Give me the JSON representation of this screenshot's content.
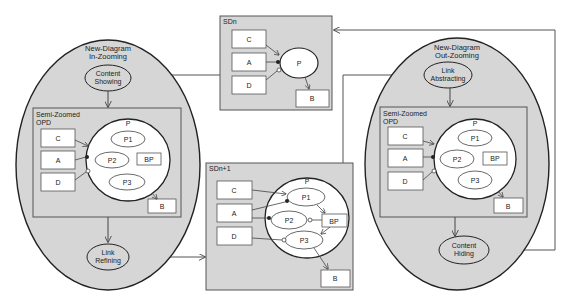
{
  "diagram": {
    "colors": {
      "panel_fill": "#d6d6d6",
      "box_fill": "#ffffff",
      "stroke": "#444444",
      "ellipse_stroke": "#222222"
    },
    "left_ellipse": {
      "title_line1": "New-Diagram",
      "title_line2": "In-Zooming",
      "top_process_line1": "Content",
      "top_process_line2": "Showing",
      "bottom_process_line1": "Link",
      "bottom_process_line2": "Refining",
      "opd_label_line1": "Semi-Zoomed",
      "opd_label_line2": "OPD"
    },
    "right_ellipse": {
      "title_line1": "New-Diagram",
      "title_line2": "Out-Zooming",
      "top_process_line1": "Link",
      "top_process_line2": "Abstracting",
      "bottom_process_line1": "Content",
      "bottom_process_line2": "Hiding",
      "opd_label_line1": "Semi-Zoomed",
      "opd_label_line2": "OPD"
    },
    "opd": {
      "objects": [
        "C",
        "A",
        "D",
        "B"
      ],
      "process": "P",
      "subprocesses": [
        "P1",
        "P2",
        "P3"
      ],
      "inner_object": "BP"
    },
    "sdn": {
      "label": "SDn",
      "objects": [
        "C",
        "A",
        "D",
        "B"
      ],
      "process": "P"
    },
    "sdn1": {
      "label": "SDn+1",
      "objects": [
        "C",
        "A",
        "D",
        "B"
      ],
      "process": "P",
      "subprocesses": [
        "P1",
        "P2",
        "P3"
      ],
      "inner_object": "BP"
    }
  }
}
